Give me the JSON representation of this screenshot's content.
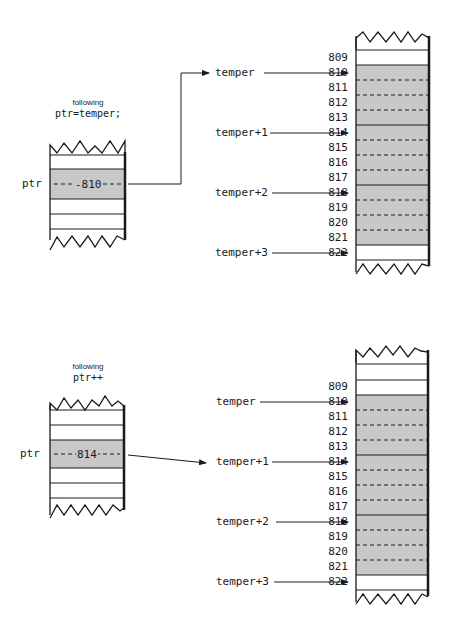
{
  "panels": [
    {
      "id": "top",
      "caption_small": "following",
      "caption_code": "ptr=temper;",
      "ptr_label": "ptr",
      "ptr_value": "-810",
      "pointer_labels": [
        "temper",
        "temper+1",
        "temper+2",
        "temper+3"
      ],
      "addresses": [
        "809",
        "810",
        "811",
        "812",
        "813",
        "814",
        "815",
        "816",
        "817",
        "818",
        "819",
        "820",
        "821",
        "822"
      ]
    },
    {
      "id": "bottom",
      "caption_small": "following",
      "caption_code": "ptr++",
      "ptr_label": "ptr",
      "ptr_value": "814",
      "pointer_labels": [
        "temper",
        "temper+1",
        "temper+2",
        "temper+3"
      ],
      "addresses": [
        "809",
        "810",
        "811",
        "812",
        "813",
        "814",
        "815",
        "816",
        "817",
        "818",
        "819",
        "820",
        "821",
        "822"
      ]
    }
  ],
  "colors": {
    "shade": "#c8c8c8",
    "line": "#1a1a1a"
  }
}
